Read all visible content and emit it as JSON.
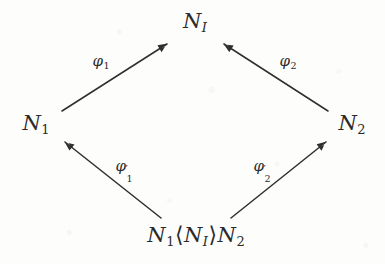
{
  "figure": {
    "kind": "commutative-diagram",
    "shape": "diamond",
    "ink_color": "#2b2b2b",
    "background_color": "#fdfdfc"
  },
  "nodes": {
    "top": {
      "id": "N_I",
      "base": "N",
      "subscript": "I",
      "subscript_style": "italic",
      "x": 195,
      "y": 22
    },
    "left": {
      "id": "N_1",
      "base": "N",
      "subscript": "1",
      "subscript_style": "numeral",
      "x": 36,
      "y": 124
    },
    "right": {
      "id": "N_2",
      "base": "N",
      "subscript": "2",
      "subscript_style": "numeral",
      "x": 352,
      "y": 124
    },
    "bottom": {
      "id": "N_1<N_I>N_2",
      "base_1": "N",
      "subscript_1": "1",
      "open_angle": "⟨",
      "inner_base": "N",
      "inner_subscript": "I",
      "close_angle": "⟩",
      "base_2": "N",
      "subscript_2": "2",
      "x": 196,
      "y": 236
    }
  },
  "edges": [
    {
      "name": "phi-1",
      "from": "N_1",
      "to": "N_I",
      "label_base": "φ",
      "label_subscript": "1",
      "label_prime": "",
      "label_x": 101,
      "label_y": 62,
      "x1": 62,
      "y1": 111,
      "x2": 167,
      "y2": 44
    },
    {
      "name": "phi-2",
      "from": "N_2",
      "to": "N_I",
      "label_base": "φ",
      "label_subscript": "2",
      "label_prime": "",
      "label_x": 288,
      "label_y": 62,
      "x1": 328,
      "y1": 111,
      "x2": 224,
      "y2": 44
    },
    {
      "name": "phi-1-prime",
      "from": "N_1<N_I>N_2",
      "to": "N_1",
      "label_base": "φ",
      "label_subscript": "1",
      "label_prime": "′",
      "label_x": 125,
      "label_y": 166,
      "x1": 161,
      "y1": 218,
      "x2": 65,
      "y2": 142
    },
    {
      "name": "phi-2-prime",
      "from": "N_1<N_I>N_2",
      "to": "N_2",
      "label_base": "φ",
      "label_subscript": "2",
      "label_prime": "′",
      "label_x": 263,
      "label_y": 166,
      "x1": 231,
      "y1": 218,
      "x2": 326,
      "y2": 142
    }
  ]
}
